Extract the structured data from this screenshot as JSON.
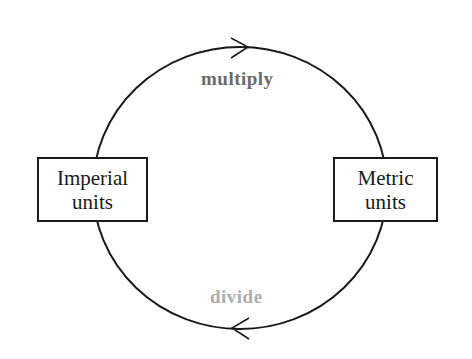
{
  "diagram": {
    "nodes": [
      {
        "id": "imperial",
        "line1": "Imperial",
        "line2": "units"
      },
      {
        "id": "metric",
        "line1": "Metric",
        "line2": "units"
      }
    ],
    "edges": [
      {
        "from": "imperial",
        "to": "metric",
        "label": "multiply",
        "direction": "clockwise-top",
        "color": "#6b6b6b"
      },
      {
        "from": "metric",
        "to": "imperial",
        "label": "divide",
        "direction": "clockwise-bottom",
        "color": "#adadad"
      }
    ],
    "stroke_color": "#1a1a1a"
  }
}
